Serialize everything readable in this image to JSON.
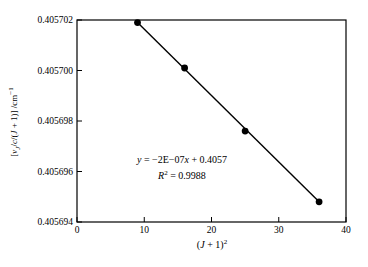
{
  "chart_data": {
    "type": "scatter",
    "title": "",
    "xlabel_text": "(J + 1)²",
    "ylabel_text": "[νJ/c/(J + 1)] /cm⁻¹",
    "xlim": [
      0,
      40
    ],
    "ylim": [
      0.405694,
      0.405702
    ],
    "x_ticks": [
      0,
      10,
      20,
      30,
      40
    ],
    "x_tick_labels": [
      "0",
      "10",
      "20",
      "30",
      "40"
    ],
    "y_ticks": [
      0.405694,
      0.405696,
      0.405698,
      0.4057,
      0.405702
    ],
    "y_tick_labels": [
      "0.405694",
      "0.405696",
      "0.405698",
      "0.405700",
      "0.405702"
    ],
    "grid": false,
    "legend": "none",
    "series": [
      {
        "name": "data-points",
        "marker": "filled-circle",
        "marker_color": "#000000",
        "x": [
          9,
          16,
          25,
          36
        ],
        "y": [
          0.4057019,
          0.4057001,
          0.4056976,
          0.4056948
        ]
      }
    ],
    "trendline": {
      "type": "linear",
      "color": "#000000",
      "equation_text": "y = −2E−07x + 0.4057",
      "r_squared_text": "R² = 0.9988",
      "r_squared": 0.9988,
      "x_start": 9,
      "x_end": 36,
      "y_start": 0.4057019,
      "y_end": 0.4056948
    },
    "xlabel_parts": [
      {
        "t": "(",
        "s": "n"
      },
      {
        "t": "J",
        "s": "i"
      },
      {
        "t": " + 1)",
        "s": "n"
      },
      {
        "t": "2",
        "s": "sup"
      }
    ],
    "ylabel_parts": [
      {
        "t": "[",
        "s": "n"
      },
      {
        "t": "ν",
        "s": "i"
      },
      {
        "t": "J",
        "s": "subi"
      },
      {
        "t": "/",
        "s": "n"
      },
      {
        "t": "c",
        "s": "i"
      },
      {
        "t": "/(",
        "s": "n"
      },
      {
        "t": "J",
        "s": "i"
      },
      {
        "t": " + 1)] /cm",
        "s": "n"
      },
      {
        "t": "−1",
        "s": "sup"
      }
    ],
    "equation_parts": [
      {
        "t": "y",
        "s": "i"
      },
      {
        "t": " = −2E−07",
        "s": "n"
      },
      {
        "t": "x",
        "s": "i"
      },
      {
        "t": " + 0.4057",
        "s": "n"
      }
    ],
    "r2_parts": [
      {
        "t": "R",
        "s": "i"
      },
      {
        "t": "2",
        "s": "sup"
      },
      {
        "t": " = 0.9988",
        "s": "n"
      }
    ]
  },
  "colors": {
    "background": "#ffffff",
    "frame": "#000000",
    "text": "#000000",
    "marker": "#000000",
    "line": "#000000"
  }
}
